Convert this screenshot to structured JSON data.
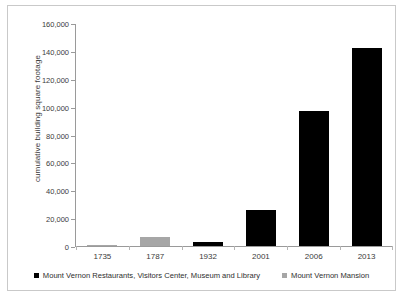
{
  "chart_data": {
    "type": "bar",
    "title": "",
    "xlabel": "",
    "ylabel": "cumulative building square footage",
    "categories": [
      "1735",
      "1787",
      "1932",
      "2001",
      "2006",
      "2013"
    ],
    "ylim": [
      0,
      160000
    ],
    "yticks": [
      0,
      20000,
      40000,
      60000,
      80000,
      100000,
      120000,
      140000,
      160000
    ],
    "ytick_labels": [
      "0",
      "20,000",
      "40,000",
      "60,000",
      "80,000",
      "100,000",
      "120,000",
      "140,000",
      "160,000"
    ],
    "grid": false,
    "legend_position": "bottom",
    "series": [
      {
        "name": "Mount Vernon Restaurants, Visitors Center, Museum and Library",
        "color": "#000000",
        "values": [
          0,
          0,
          2800,
          26000,
          97000,
          142000
        ]
      },
      {
        "name": "Mount Vernon Mansion",
        "color": "#a6a6a6",
        "values": [
          1000,
          6500,
          0,
          0,
          0,
          0
        ]
      }
    ],
    "bars": [
      {
        "category": "1735",
        "value": 1000,
        "series": "Mount Vernon Mansion",
        "color": "#a6a6a6"
      },
      {
        "category": "1787",
        "value": 6500,
        "series": "Mount Vernon Mansion",
        "color": "#a6a6a6"
      },
      {
        "category": "1932",
        "value": 2800,
        "series": "Mount Vernon Restaurants, Visitors Center, Museum and Library",
        "color": "#000000"
      },
      {
        "category": "2001",
        "value": 26000,
        "series": "Mount Vernon Restaurants, Visitors Center, Museum and Library",
        "color": "#000000"
      },
      {
        "category": "2006",
        "value": 97000,
        "series": "Mount Vernon Restaurants, Visitors Center, Museum and Library",
        "color": "#000000"
      },
      {
        "category": "2013",
        "value": 142000,
        "series": "Mount Vernon Restaurants, Visitors Center, Museum and Library",
        "color": "#000000"
      }
    ]
  },
  "axis": {
    "y_title": "cumulative building square footage",
    "y_labels": [
      "160,000",
      "140,000",
      "120,000",
      "100,000",
      "80,000",
      "60,000",
      "40,000",
      "20,000",
      "0"
    ],
    "x_labels": [
      "1735",
      "1787",
      "1932",
      "2001",
      "2006",
      "2013"
    ]
  },
  "legend": {
    "items": [
      {
        "label": "Mount Vernon Restaurants, Visitors Center, Museum and Library",
        "color": "#000000"
      },
      {
        "label": "Mount Vernon Mansion",
        "color": "#a6a6a6"
      }
    ]
  },
  "colors": {
    "series_a": "#000000",
    "series_b": "#a6a6a6",
    "axis": "#9a9a9a",
    "frame": "#c9c9c9",
    "text": "#3b3b3b",
    "background": "#ffffff"
  }
}
